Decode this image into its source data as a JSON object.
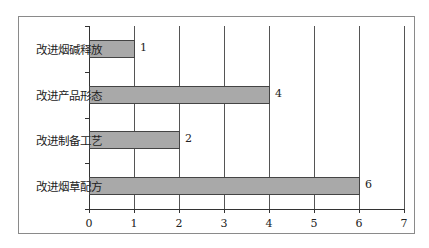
{
  "chart_data": {
    "type": "bar",
    "orientation": "horizontal",
    "title": "",
    "xlabel": "",
    "ylabel": "",
    "categories": [
      "改进烟碱释放",
      "改进产品形态",
      "改进制备工艺",
      "改进烟草配方"
    ],
    "values": [
      1,
      4,
      2,
      6
    ],
    "value_labels": [
      "1",
      "4",
      "2",
      "6"
    ],
    "xlim": [
      0,
      7
    ],
    "x_ticks": [
      "0",
      "1",
      "2",
      "3",
      "4",
      "5",
      "6",
      "7"
    ],
    "grid": "vertical",
    "legend": null,
    "bar_color": "#a9a9a9"
  }
}
